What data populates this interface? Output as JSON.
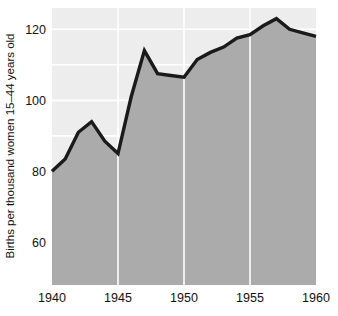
{
  "chart_data": {
    "type": "area",
    "title": "",
    "subtitle": "",
    "xlabel": "",
    "ylabel": "Births per thousand women 15–44 years old",
    "x": [
      1940,
      1941,
      1942,
      1943,
      1944,
      1945,
      1946,
      1947,
      1948,
      1949,
      1950,
      1951,
      1952,
      1953,
      1954,
      1955,
      1956,
      1957,
      1958,
      1959,
      1960
    ],
    "values": [
      80,
      83.5,
      91,
      94,
      88.5,
      85,
      101,
      114,
      107.5,
      107,
      106.5,
      111.5,
      113.5,
      115,
      117.5,
      118.5,
      121,
      123,
      120,
      119,
      118
    ],
    "series": [
      {
        "name": "Births per thousand women 15–44 years old",
        "values": [
          80,
          83.5,
          91,
          94,
          88.5,
          85,
          101,
          114,
          107.5,
          107,
          106.5,
          111.5,
          113.5,
          115,
          117.5,
          118.5,
          121,
          123,
          120,
          119,
          118
        ]
      }
    ],
    "xlim": [
      1940,
      1960
    ],
    "ylim": [
      48,
      126
    ],
    "xticks": [
      1940,
      1945,
      1950,
      1955,
      1960
    ],
    "xtick_labels": [
      "1940",
      "1945",
      "1950",
      "1955",
      "1960"
    ],
    "yticks": [
      60,
      80,
      100,
      120
    ],
    "ytick_labels": [
      "60",
      "80",
      "100",
      "120"
    ],
    "grid": {
      "horizontal": true,
      "vertical": true,
      "horizontal_values": [
        60,
        70,
        80,
        90,
        100,
        110,
        120
      ],
      "vertical_values": [
        1945,
        1950,
        1955
      ],
      "color": "#ffffff"
    },
    "legend": {
      "visible": false,
      "position": "none",
      "entries": []
    },
    "colors": {
      "plot_background": "#ededed",
      "area_fill": "#ababab",
      "line": "#1a1a1a",
      "gridline": "#ffffff",
      "text": "#111111",
      "page_background": "#ffffff"
    },
    "line_width": 3.4
  },
  "axes": {
    "y_axis_title": "Births per thousand women 15–44 years old",
    "x_axis_title": ""
  }
}
